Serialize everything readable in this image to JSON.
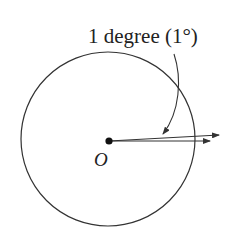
{
  "diagram": {
    "label": "1 degree (1°)",
    "center_label": "O",
    "stroke_color": "#333333",
    "circle": {
      "cx": 108,
      "cy": 139,
      "r": 87
    },
    "center_point": {
      "x": 109,
      "y": 141
    },
    "rays": [
      {
        "x2": 220,
        "y2": 135
      },
      {
        "x2": 210,
        "y2": 141
      }
    ]
  }
}
